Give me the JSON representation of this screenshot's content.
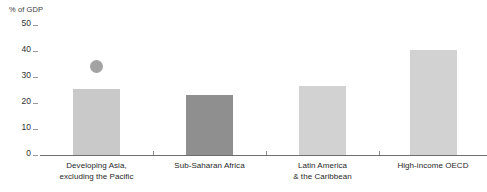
{
  "chart_data": {
    "type": "bar",
    "title": "",
    "subtitle": "",
    "xlabel": "",
    "ylabel": "% of GDP",
    "ylim": [
      0,
      50
    ],
    "grid": false,
    "legend": "none",
    "y_ticks": [
      "50",
      "40",
      "30",
      "20",
      "10",
      "0"
    ],
    "y_tick_values": [
      50,
      40,
      30,
      20,
      10,
      0
    ],
    "categories": [
      "Developing Asia, excluding the Pacific",
      "Sub-Saharan Africa",
      "Latin America & the Caribbean",
      "High-income OECD"
    ],
    "category_lines": [
      [
        "Developing Asia,",
        "excluding the Pacific"
      ],
      [
        "Sub-Saharan Africa"
      ],
      [
        "Latin America",
        "& the Caribbean"
      ],
      [
        "High-income OECD"
      ]
    ],
    "values": [
      25.5,
      23.0,
      26.5,
      40.5
    ],
    "bar_colors": [
      "#c9c9c9",
      "#8f8f8f",
      "#d2d2d2",
      "#d2d2d2"
    ],
    "markers": [
      {
        "category": "Developing Asia, excluding the Pacific",
        "value": 34.0,
        "color": "#a3a3a3",
        "shape": "circle"
      }
    ],
    "axis_color": "#6e6e6e"
  }
}
